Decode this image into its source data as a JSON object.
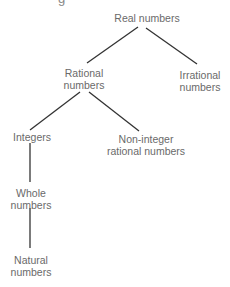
{
  "cutoff_heading_fragment": "g",
  "diagram": {
    "type": "tree",
    "colors": {
      "text": "#6a6a6a",
      "line": "#333333",
      "background": "#ffffff"
    },
    "nodes": [
      {
        "id": "real",
        "line1": "Real numbers",
        "line2": ""
      },
      {
        "id": "rational",
        "line1": "Rational",
        "line2": "numbers"
      },
      {
        "id": "irrational",
        "line1": "Irrational",
        "line2": "numbers"
      },
      {
        "id": "integers",
        "line1": "Integers",
        "line2": ""
      },
      {
        "id": "noninteger",
        "line1": "Non-integer",
        "line2": "rational numbers"
      },
      {
        "id": "whole",
        "line1": "Whole",
        "line2": "numbers"
      },
      {
        "id": "natural",
        "line1": "Natural",
        "line2": "numbers"
      }
    ],
    "edges": [
      {
        "from": "real",
        "to": "rational"
      },
      {
        "from": "real",
        "to": "irrational"
      },
      {
        "from": "rational",
        "to": "integers"
      },
      {
        "from": "rational",
        "to": "noninteger"
      },
      {
        "from": "integers",
        "to": "whole"
      },
      {
        "from": "whole",
        "to": "natural"
      }
    ]
  }
}
